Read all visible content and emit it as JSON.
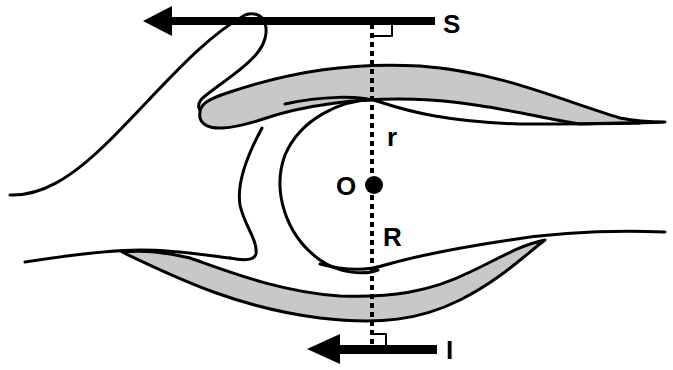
{
  "diagram": {
    "title": "",
    "labels": {
      "superior": "S",
      "inferior": "I",
      "center": "O",
      "upper_radius": "r",
      "lower_radius": "R"
    },
    "arrows": [
      {
        "name": "superior-arrow",
        "direction": "left",
        "label_key": "superior"
      },
      {
        "name": "inferior-arrow",
        "direction": "left",
        "label_key": "inferior"
      }
    ],
    "structures": [
      "upper-eyelid-margin",
      "lower-eyelid-margin",
      "globe-circle",
      "center-point",
      "vertical-axis"
    ],
    "colors": {
      "line": "#000000",
      "shading": "#c8c8c8",
      "background": "#ffffff"
    }
  }
}
